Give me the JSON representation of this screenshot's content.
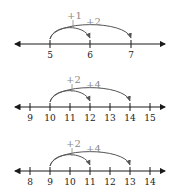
{
  "colors": {
    "axis": "#1a1a1a",
    "arc": "#555555",
    "jump_label": "#888888"
  },
  "number_lines": [
    {
      "y": 44,
      "x_left": 12,
      "x_right": 168,
      "ticks": [
        {
          "x": 50,
          "label": "5"
        },
        {
          "x": 90,
          "label": "6"
        },
        {
          "x": 131,
          "label": "7"
        }
      ],
      "start_x": 50,
      "jumps": [
        {
          "label": "+1",
          "end_x": 90,
          "label_x": 67,
          "label_y": 19,
          "height": 15
        },
        {
          "label": "+2",
          "end_x": 131,
          "label_x": 86,
          "label_y": 25,
          "height": 19
        }
      ]
    },
    {
      "y": 107,
      "x_left": 12,
      "x_right": 168,
      "ticks": [
        {
          "x": 30,
          "label": "9"
        },
        {
          "x": 50,
          "label": "10"
        },
        {
          "x": 70,
          "label": "11"
        },
        {
          "x": 90,
          "label": "12"
        },
        {
          "x": 110,
          "label": "13"
        },
        {
          "x": 130,
          "label": "14"
        },
        {
          "x": 150,
          "label": "15"
        }
      ],
      "start_x": 50,
      "jumps": [
        {
          "label": "+2",
          "end_x": 90,
          "label_x": 66,
          "label_y": 83,
          "height": 15
        },
        {
          "label": "+4",
          "end_x": 130,
          "label_x": 86,
          "label_y": 88,
          "height": 19
        }
      ]
    },
    {
      "y": 171,
      "x_left": 12,
      "x_right": 168,
      "ticks": [
        {
          "x": 30,
          "label": "8"
        },
        {
          "x": 50,
          "label": "9"
        },
        {
          "x": 70,
          "label": "10"
        },
        {
          "x": 90,
          "label": "11"
        },
        {
          "x": 110,
          "label": "12"
        },
        {
          "x": 130,
          "label": "13"
        },
        {
          "x": 150,
          "label": "14"
        }
      ],
      "start_x": 50,
      "jumps": [
        {
          "label": "+2",
          "end_x": 90,
          "label_x": 66,
          "label_y": 147,
          "height": 15
        },
        {
          "label": "+4",
          "end_x": 130,
          "label_x": 86,
          "label_y": 152,
          "height": 19
        }
      ]
    }
  ]
}
